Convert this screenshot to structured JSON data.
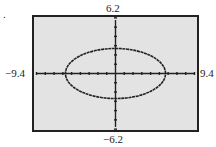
{
  "figure": {
    "marker": ".",
    "labels": {
      "ymax": "6.2",
      "ymin": "−6.2",
      "xmin": "−9.4",
      "xmax": "9.4"
    },
    "colors": {
      "plot_background": "#e3e3e3",
      "frame": "#222222",
      "curve": "#222222",
      "axes": "#222222"
    }
  },
  "chart_data": {
    "type": "line",
    "title": "",
    "xlabel": "",
    "ylabel": "",
    "xlim": [
      -9.4,
      9.4
    ],
    "ylim": [
      -6.2,
      6.2
    ],
    "x_ticks_step": 1,
    "y_ticks_step": 1,
    "grid": false,
    "legend": null,
    "series": [
      {
        "name": "ellipse",
        "shape": "ellipse",
        "center": [
          0,
          0
        ],
        "semi_axis_x": 5.7,
        "semi_axis_y": 2.7,
        "points": [
          [
            5.7,
            0
          ],
          [
            4.94,
            1.35
          ],
          [
            2.85,
            2.34
          ],
          [
            0,
            2.7
          ],
          [
            -2.85,
            2.34
          ],
          [
            -4.94,
            1.35
          ],
          [
            -5.7,
            0
          ],
          [
            -4.94,
            -1.35
          ],
          [
            -2.85,
            -2.34
          ],
          [
            0,
            -2.7
          ],
          [
            2.85,
            -2.34
          ],
          [
            4.94,
            -1.35
          ],
          [
            5.7,
            0
          ]
        ]
      }
    ],
    "window_labels": {
      "xmin": "-9.4",
      "xmax": "9.4",
      "ymin": "-6.2",
      "ymax": "6.2"
    }
  }
}
